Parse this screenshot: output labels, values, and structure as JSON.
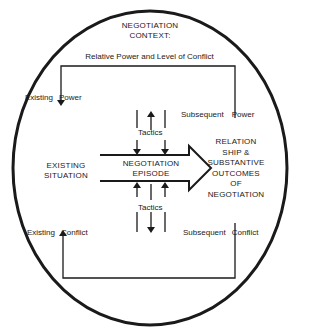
{
  "context": {
    "title_line1": "NEGOTIATION",
    "title_line2": "CONTEXT:",
    "subtitle": "Relative Power and Level of Conflict"
  },
  "labels": {
    "existing_power": "Existing",
    "existing_power_2": "Power",
    "subsequent_power": "Subsequent",
    "subsequent_power_2": "Power",
    "existing_conflict": "Existing",
    "existing_conflict_2": "Conflict",
    "subsequent_conflict": "Subsequent",
    "subsequent_conflict_2": "Conflict",
    "tactics_top": "Tactics",
    "tactics_bottom": "Tactics"
  },
  "existing_situation": {
    "line1": "EXISTING",
    "line2": "SITUATION"
  },
  "episode": {
    "line1": "NEGOTIATION",
    "line2": "EPISODE"
  },
  "outcomes": {
    "line1": "RELATION",
    "line2": "SHIP &",
    "line3": "SUBSTANTIVE",
    "line4": "OUTCOMES",
    "line5": "OF",
    "line6": "NEGOTIATION"
  },
  "colors": {
    "ink": "#1a1a1a",
    "background": "#ffffff"
  }
}
